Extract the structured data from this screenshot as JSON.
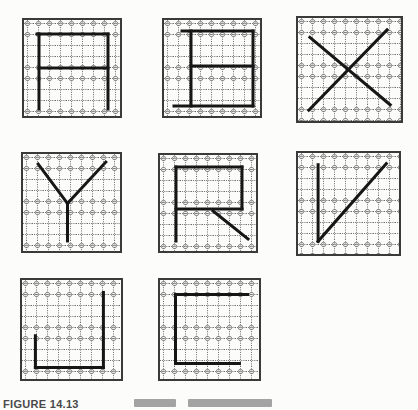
{
  "page": {
    "background": "#fcfcfb"
  },
  "figure": {
    "style": {
      "cell_border": "#3a3a3a",
      "dot_color": "#6a6a6a",
      "ring_color": "#7d7d7d",
      "stroke_color": "#161616",
      "stroke_width": 3,
      "grid_spacing": 11
    },
    "cells": [
      {
        "letter": "A",
        "x": 22,
        "y": 18,
        "size": 100,
        "strokes": [
          [
            0.17,
            0.16,
            0.17,
            0.91
          ],
          [
            0.15,
            0.16,
            0.86,
            0.16
          ],
          [
            0.86,
            0.16,
            0.86,
            0.91
          ],
          [
            0.17,
            0.5,
            0.86,
            0.5
          ]
        ]
      },
      {
        "letter": "B",
        "x": 162,
        "y": 18,
        "size": 100,
        "strokes": [
          [
            0.2,
            0.13,
            0.91,
            0.13
          ],
          [
            0.29,
            0.13,
            0.29,
            0.88
          ],
          [
            0.91,
            0.13,
            0.91,
            0.88
          ],
          [
            0.29,
            0.48,
            0.91,
            0.48
          ],
          [
            0.12,
            0.88,
            0.91,
            0.88
          ]
        ]
      },
      {
        "letter": "X",
        "x": 296,
        "y": 16,
        "size": 107,
        "strokes": [
          [
            0.13,
            0.2,
            0.88,
            0.83
          ],
          [
            0.85,
            0.13,
            0.12,
            0.88
          ]
        ]
      },
      {
        "letter": "Y",
        "x": 21,
        "y": 152,
        "size": 101,
        "strokes": [
          [
            0.17,
            0.12,
            0.46,
            0.51
          ],
          [
            0.84,
            0.1,
            0.46,
            0.51
          ],
          [
            0.46,
            0.51,
            0.46,
            0.88
          ]
        ]
      },
      {
        "letter": "R",
        "x": 158,
        "y": 153,
        "size": 100,
        "strokes": [
          [
            0.18,
            0.14,
            0.84,
            0.14
          ],
          [
            0.18,
            0.14,
            0.18,
            0.88
          ],
          [
            0.84,
            0.14,
            0.84,
            0.56
          ],
          [
            0.18,
            0.56,
            0.84,
            0.56
          ],
          [
            0.55,
            0.58,
            0.9,
            0.86
          ]
        ]
      },
      {
        "letter": "V",
        "x": 296,
        "y": 151,
        "size": 105,
        "strokes": [
          [
            0.21,
            0.13,
            0.21,
            0.86
          ],
          [
            0.21,
            0.86,
            0.86,
            0.12
          ]
        ]
      },
      {
        "letter": "J",
        "x": 20,
        "y": 278,
        "size": 103,
        "strokes": [
          [
            0.81,
            0.14,
            0.81,
            0.87
          ],
          [
            0.15,
            0.87,
            0.81,
            0.87
          ],
          [
            0.15,
            0.56,
            0.15,
            0.87
          ]
        ]
      },
      {
        "letter": "C",
        "x": 158,
        "y": 278,
        "size": 103,
        "strokes": [
          [
            0.17,
            0.16,
            0.87,
            0.16
          ],
          [
            0.17,
            0.16,
            0.17,
            0.83
          ],
          [
            0.17,
            0.83,
            0.79,
            0.83
          ]
        ]
      }
    ]
  },
  "caption": {
    "label": "FIGURE 14.13"
  }
}
